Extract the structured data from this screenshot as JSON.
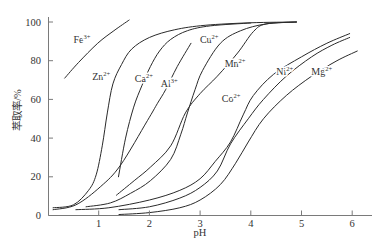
{
  "chart_data": {
    "type": "line",
    "title": "",
    "xlabel": "pH",
    "ylabel": "萃取率/%",
    "xlim": [
      0,
      6.4
    ],
    "ylim": [
      0,
      102.5
    ],
    "xticks": [
      1,
      2,
      3,
      4,
      5,
      6
    ],
    "yticks": [
      0,
      20,
      40,
      60,
      80,
      100
    ],
    "grid": false,
    "legend": "inline labels on curves",
    "series": [
      {
        "name": "Fe3+",
        "symbol": "Fe",
        "charge": "3+",
        "label_pos": [
          0.67,
          90.7
        ],
        "points": [
          [
            0.33,
            71
          ],
          [
            0.6,
            79
          ],
          [
            0.98,
            89
          ],
          [
            1.3,
            95.5
          ],
          [
            1.6,
            101
          ]
        ]
      },
      {
        "name": "Zn2+",
        "symbol": "Zn",
        "charge": "2+",
        "label_pos": [
          1.05,
          71.6
        ],
        "points": [
          [
            0.1,
            4
          ],
          [
            0.5,
            5.5
          ],
          [
            0.8,
            13
          ],
          [
            0.95,
            21
          ],
          [
            1.07,
            36
          ],
          [
            1.17,
            53
          ],
          [
            1.28,
            68
          ],
          [
            1.45,
            78
          ],
          [
            1.65,
            86
          ],
          [
            2.0,
            92
          ],
          [
            2.5,
            96
          ],
          [
            3.1,
            98.3
          ],
          [
            4.0,
            99.6
          ],
          [
            4.9,
            100
          ]
        ]
      },
      {
        "name": "Ca2+",
        "symbol": "Ca",
        "charge": "2+",
        "label_pos": [
          1.89,
          71
        ],
        "points": [
          [
            1.39,
            20
          ],
          [
            1.53,
            40
          ],
          [
            1.69,
            56
          ],
          [
            1.85,
            67
          ],
          [
            2.02,
            77
          ],
          [
            2.2,
            85
          ],
          [
            2.42,
            91
          ],
          [
            2.75,
            95.5
          ],
          [
            3.2,
            98
          ],
          [
            4.0,
            99.5
          ]
        ]
      },
      {
        "name": "Al3+",
        "symbol": "Al",
        "charge": "3+",
        "label_pos": [
          2.39,
          68
        ],
        "points": [
          [
            0.1,
            3
          ],
          [
            0.55,
            5.5
          ],
          [
            1.04,
            15
          ],
          [
            1.43,
            26
          ],
          [
            1.96,
            49
          ],
          [
            2.16,
            58
          ],
          [
            2.32,
            65
          ],
          [
            2.55,
            77
          ],
          [
            2.82,
            89
          ]
        ]
      },
      {
        "name": "Cu2+",
        "symbol": "Cu",
        "charge": "2+",
        "label_pos": [
          3.18,
          90.7
        ],
        "points": [
          [
            0.75,
            4.5
          ],
          [
            1.23,
            6.5
          ],
          [
            1.63,
            11.5
          ],
          [
            2.02,
            18
          ],
          [
            2.42,
            29
          ],
          [
            2.62,
            42
          ],
          [
            2.75,
            53
          ],
          [
            2.9,
            65
          ],
          [
            3.05,
            75
          ],
          [
            3.4,
            89
          ],
          [
            3.8,
            95.5
          ],
          [
            4.3,
            99
          ],
          [
            4.9,
            100
          ]
        ]
      },
      {
        "name": "Mn2+",
        "symbol": "Mn",
        "charge": "2+",
        "label_pos": [
          3.69,
          78.8
        ],
        "points": [
          [
            1.35,
            10.5
          ],
          [
            1.7,
            18
          ],
          [
            2.02,
            25
          ],
          [
            2.42,
            36
          ],
          [
            2.71,
            53
          ],
          [
            3.0,
            63
          ],
          [
            3.34,
            72
          ],
          [
            3.74,
            84
          ],
          [
            4.05,
            95
          ],
          [
            4.3,
            99
          ],
          [
            4.9,
            100
          ]
        ]
      },
      {
        "name": "Co2+",
        "symbol": "Co",
        "charge": "2+",
        "label_pos": [
          3.61,
          60.7
        ],
        "points": [
          [
            0.55,
            3
          ],
          [
            1.2,
            4
          ],
          [
            2.0,
            8
          ],
          [
            2.6,
            13
          ],
          [
            3.0,
            19
          ],
          [
            3.3,
            28
          ],
          [
            3.6,
            38
          ],
          [
            3.85,
            52
          ],
          [
            4.05,
            62
          ],
          [
            4.45,
            73
          ],
          [
            5.0,
            82
          ],
          [
            5.5,
            89
          ],
          [
            5.95,
            94
          ]
        ]
      },
      {
        "name": "Ni2+",
        "symbol": "Ni",
        "charge": "2+",
        "label_pos": [
          4.67,
          74.2
        ],
        "points": [
          [
            1.4,
            3
          ],
          [
            2.0,
            4.5
          ],
          [
            2.6,
            9
          ],
          [
            3.0,
            14.5
          ],
          [
            3.34,
            23
          ],
          [
            3.6,
            37
          ],
          [
            3.95,
            50
          ],
          [
            4.25,
            60
          ],
          [
            4.7,
            72
          ],
          [
            5.2,
            82
          ],
          [
            5.6,
            88
          ],
          [
            5.95,
            92
          ]
        ]
      },
      {
        "name": "Mg2+",
        "symbol": "Mg",
        "charge": "2+",
        "label_pos": [
          5.4,
          74.2
        ],
        "points": [
          [
            1.4,
            0.5
          ],
          [
            2.0,
            1.5
          ],
          [
            2.6,
            4
          ],
          [
            3.0,
            8
          ],
          [
            3.4,
            16
          ],
          [
            3.7,
            27
          ],
          [
            3.95,
            38
          ],
          [
            4.25,
            50
          ],
          [
            4.7,
            62
          ],
          [
            5.2,
            72
          ],
          [
            5.7,
            80
          ],
          [
            6.1,
            85
          ]
        ]
      }
    ]
  }
}
